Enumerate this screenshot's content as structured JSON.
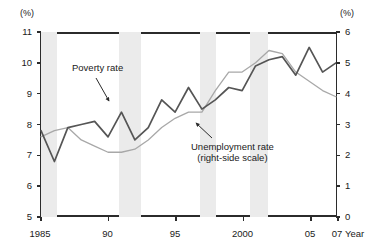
{
  "chart_data": {
    "type": "line",
    "title": "",
    "xlabel": "Year",
    "x_tick_labels": [
      "1985",
      "90",
      "95",
      "2000",
      "05",
      "07"
    ],
    "x_tick_years": [
      1985,
      1990,
      1995,
      2000,
      2005,
      2007
    ],
    "xlim": [
      1985,
      2007
    ],
    "left_axis": {
      "unit_label": "(%)",
      "ylim": [
        5,
        11
      ],
      "ticks": [
        5,
        6,
        7,
        8,
        9,
        10,
        11
      ],
      "tick_labels": [
        "5",
        "6",
        "7",
        "8",
        "9",
        "10",
        "11"
      ]
    },
    "right_axis": {
      "unit_label": "(%)",
      "ylim": [
        0,
        6
      ],
      "ticks": [
        0,
        1,
        2,
        3,
        4,
        5,
        6
      ],
      "tick_labels": [
        "0",
        "1",
        "2",
        "3",
        "4",
        "5",
        "6"
      ]
    },
    "grid": false,
    "legend": "inline-annotations",
    "x": [
      1985,
      1986,
      1987,
      1988,
      1989,
      1990,
      1991,
      1992,
      1993,
      1994,
      1995,
      1996,
      1997,
      1998,
      1999,
      2000,
      2001,
      2002,
      2003,
      2004,
      2005,
      2006,
      2007
    ],
    "series": [
      {
        "name": "Poverty rate",
        "axis": "left",
        "color": "#555555",
        "values": [
          7.8,
          6.8,
          7.9,
          8.0,
          8.1,
          7.6,
          8.4,
          7.5,
          7.9,
          8.8,
          8.4,
          9.2,
          8.5,
          8.8,
          9.2,
          9.1,
          9.9,
          10.1,
          10.2,
          9.6,
          10.5,
          9.7,
          10.0
        ]
      },
      {
        "name": "Unemployment rate (right-side scale)",
        "axis": "right",
        "color": "#a8a8a8",
        "values": [
          2.6,
          2.8,
          2.9,
          2.5,
          2.3,
          2.1,
          2.1,
          2.2,
          2.5,
          2.9,
          3.2,
          3.4,
          3.4,
          4.1,
          4.7,
          4.7,
          5.0,
          5.4,
          5.3,
          4.7,
          4.4,
          4.1,
          3.9
        ]
      }
    ],
    "shaded_bands": [
      {
        "name": "recession-band-1",
        "start": 1985.0,
        "end": 1986.2
      },
      {
        "name": "recession-band-2",
        "start": 1990.8,
        "end": 1992.4
      },
      {
        "name": "recession-band-3",
        "start": 1996.8,
        "end": 1998.0
      },
      {
        "name": "recession-band-4",
        "start": 2000.5,
        "end": 2001.8
      }
    ],
    "annotations": [
      {
        "name": "poverty-rate-label",
        "text": "Poverty rate",
        "target_series": "Poverty rate"
      },
      {
        "name": "unemployment-rate-label",
        "line1": "Unemployment rate",
        "line2": "(right-side scale)",
        "target_series": "Unemployment rate (right-side scale)"
      }
    ]
  }
}
